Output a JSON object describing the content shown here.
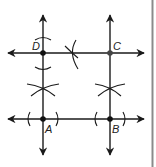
{
  "diagram": {
    "type": "geometric-construction",
    "colors": {
      "line": "#1a1a1a",
      "point": "#111111",
      "point_c": "#444444",
      "arc": "#1a1a1a",
      "border": "#888888"
    },
    "points": [
      {
        "id": "A",
        "label": "A",
        "x": 43,
        "y": 119
      },
      {
        "id": "B",
        "label": "B",
        "x": 110,
        "y": 119
      },
      {
        "id": "C",
        "label": "C",
        "x": 110,
        "y": 53
      },
      {
        "id": "D",
        "label": "D",
        "x": 43,
        "y": 53
      }
    ],
    "lines": [
      {
        "id": "line-AB",
        "direction": "horizontal",
        "y": 119,
        "x1": 8,
        "x2": 144
      },
      {
        "id": "line-DC",
        "direction": "horizontal",
        "y": 53,
        "x1": 8,
        "x2": 144
      },
      {
        "id": "line-AD",
        "direction": "vertical",
        "x": 43,
        "y1": 15,
        "y2": 155
      },
      {
        "id": "line-BC",
        "direction": "vertical",
        "x": 110,
        "y1": 15,
        "y2": 155
      }
    ]
  }
}
